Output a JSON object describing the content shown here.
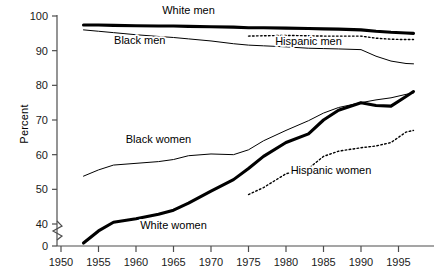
{
  "chart_data": {
    "type": "line",
    "title": "",
    "xlabel": "",
    "ylabel": "Percent",
    "xlim": [
      1948,
      1998
    ],
    "ylim": [
      38,
      100
    ],
    "grid": false,
    "legend_position": "inline-labels",
    "axis_break": {
      "present": true,
      "between": [
        0,
        40
      ],
      "axis": "y"
    },
    "ytick_labels": [
      "0",
      "40",
      "50",
      "60",
      "70",
      "80",
      "90",
      "100"
    ],
    "ytick_values": [
      0,
      40,
      50,
      60,
      70,
      80,
      90,
      100
    ],
    "xtick_labels": [
      "1950",
      "1955",
      "1960",
      "1965",
      "1970",
      "1975",
      "1980",
      "1985",
      "1990",
      "1995"
    ],
    "xtick_values": [
      1950,
      1955,
      1960,
      1965,
      1970,
      1975,
      1980,
      1985,
      1990,
      1995
    ],
    "series": [
      {
        "name": "White men",
        "style": "thick-solid",
        "label_x": 1967,
        "label_y": 100.5,
        "x": [
          1953,
          1955,
          1957,
          1960,
          1963,
          1965,
          1967,
          1970,
          1973,
          1975,
          1977,
          1980,
          1983,
          1985,
          1987,
          1990,
          1992,
          1994,
          1996,
          1997
        ],
        "values": [
          97.4,
          97.4,
          97.3,
          97.2,
          97.1,
          97.1,
          97.0,
          96.9,
          96.8,
          96.6,
          96.6,
          96.5,
          96.4,
          96.3,
          96.2,
          96.0,
          95.6,
          95.3,
          95.1,
          95.0
        ]
      },
      {
        "name": "Black men",
        "style": "thin-solid",
        "label_x": 1960.5,
        "label_y": 92.0,
        "x": [
          1953,
          1955,
          1957,
          1960,
          1963,
          1965,
          1967,
          1970,
          1973,
          1975,
          1977,
          1980,
          1983,
          1985,
          1987,
          1990,
          1992,
          1994,
          1996,
          1997
        ],
        "values": [
          96.0,
          95.6,
          95.2,
          94.6,
          94.1,
          93.8,
          93.4,
          92.8,
          92.0,
          91.6,
          91.4,
          91.1,
          90.7,
          90.6,
          90.5,
          90.3,
          88.4,
          87.0,
          86.3,
          86.2
        ]
      },
      {
        "name": "Hispanic men",
        "style": "dotted",
        "label_x": 1983,
        "label_y": 91.5,
        "x": [
          1975,
          1977,
          1980,
          1983,
          1985,
          1987,
          1990,
          1992,
          1994,
          1996,
          1997
        ],
        "values": [
          94.2,
          94.3,
          94.4,
          94.3,
          94.2,
          94.2,
          94.2,
          93.6,
          93.3,
          93.2,
          93.2
        ]
      },
      {
        "name": "Black women",
        "style": "thin-solid",
        "label_x": 1963,
        "label_y": 63.5,
        "x": [
          1953,
          1955,
          1957,
          1960,
          1963,
          1965,
          1967,
          1970,
          1973,
          1975,
          1977,
          1980,
          1983,
          1985,
          1987,
          1990,
          1992,
          1994,
          1996,
          1997
        ],
        "values": [
          53.8,
          55.6,
          57.0,
          57.5,
          58.0,
          58.6,
          59.7,
          60.2,
          60.0,
          61.4,
          64.0,
          67.0,
          69.8,
          72.0,
          73.6,
          75.0,
          75.8,
          76.4,
          77.4,
          77.8
        ]
      },
      {
        "name": "White women",
        "style": "thick-solid",
        "label_x": 1965,
        "label_y": 38.5,
        "x": [
          1953,
          1955,
          1957,
          1960,
          1963,
          1965,
          1967,
          1970,
          1973,
          1975,
          1977,
          1980,
          1983,
          1985,
          1987,
          1990,
          1992,
          1994,
          1996,
          1997
        ],
        "values": [
          34.5,
          38.0,
          40.5,
          41.5,
          42.8,
          44.0,
          46.0,
          49.5,
          52.8,
          56.0,
          59.5,
          63.5,
          66.0,
          70.0,
          72.8,
          75.0,
          74.2,
          74.0,
          76.8,
          78.2
        ]
      },
      {
        "name": "Hispanic women",
        "style": "dotted",
        "label_x": 1986,
        "label_y": 54.5,
        "x": [
          1975,
          1977,
          1980,
          1983,
          1985,
          1987,
          1990,
          1992,
          1994,
          1996,
          1997
        ],
        "values": [
          48.5,
          50.5,
          54.5,
          56.0,
          59.5,
          61.0,
          62.0,
          62.5,
          63.5,
          66.5,
          67.0
        ]
      }
    ]
  }
}
